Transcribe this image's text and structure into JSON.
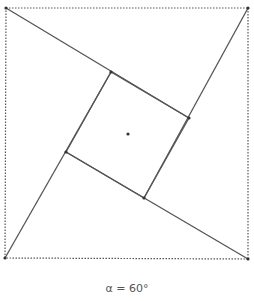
{
  "diagram": {
    "caption": "α = 60°",
    "angle_deg": 60,
    "colors": {
      "line": "#555555",
      "dotted": "#555555",
      "point": "#333333"
    },
    "outer_square": {
      "style": "dotted",
      "vertices": [
        {
          "name": "top-left",
          "x": 6,
          "y": 8
        },
        {
          "name": "top-right",
          "x": 248,
          "y": 8
        },
        {
          "name": "bottom-right",
          "x": 248,
          "y": 259
        },
        {
          "name": "bottom-left",
          "x": 5,
          "y": 258
        }
      ]
    },
    "inner_square": {
      "style": "solid",
      "vertices": [
        {
          "name": "top",
          "x": 111,
          "y": 72
        },
        {
          "name": "right",
          "x": 189,
          "y": 118
        },
        {
          "name": "bottom",
          "x": 144,
          "y": 198
        },
        {
          "name": "left",
          "x": 66,
          "y": 152
        }
      ]
    },
    "center_point": {
      "x": 128,
      "y": 134
    },
    "spokes": [
      {
        "from": {
          "x": 6,
          "y": 8
        },
        "to": {
          "x": 189,
          "y": 118
        }
      },
      {
        "from": {
          "x": 248,
          "y": 8
        },
        "to": {
          "x": 144,
          "y": 198
        }
      },
      {
        "from": {
          "x": 248,
          "y": 259
        },
        "to": {
          "x": 66,
          "y": 152
        }
      },
      {
        "from": {
          "x": 5,
          "y": 258
        },
        "to": {
          "x": 111,
          "y": 72
        }
      }
    ]
  }
}
